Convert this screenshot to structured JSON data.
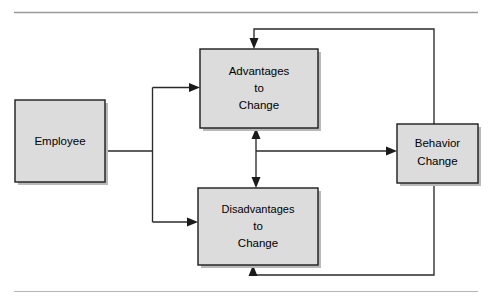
{
  "figure": {
    "type": "flow-diagram",
    "title_fragment": "",
    "background_color": "#ffffff",
    "box_fill_color": "#dcdcdc",
    "box_border_color": "#1c1c1c",
    "connector_color": "#2a2a2a",
    "rule_color": "#9a9a9a"
  },
  "rules": {
    "top_rule_label": "top-horizontal-rule",
    "bottom_rule_label": "bottom-horizontal-rule"
  },
  "nodes": [
    {
      "id": "employee",
      "lines": [
        "Employee"
      ],
      "x": 15,
      "y": 100,
      "w": 90,
      "h": 82
    },
    {
      "id": "advantages",
      "lines": [
        "Advantages",
        "to",
        "Change"
      ],
      "x": 200,
      "y": 49,
      "w": 118,
      "h": 79
    },
    {
      "id": "disadvantages",
      "lines": [
        "Disadvantages",
        "to",
        "Change"
      ],
      "x": 198,
      "y": 188,
      "w": 120,
      "h": 77
    },
    {
      "id": "behavior_change",
      "lines": [
        "Behavior",
        "Change"
      ],
      "x": 397,
      "y": 124,
      "w": 81,
      "h": 59
    }
  ],
  "node_text": {
    "employee": "Employee",
    "advantages_line1": "Advantages",
    "advantages_line2": "to",
    "advantages_line3": "Change",
    "disadvantages_line1": "Disadvantages",
    "disadvantages_line2": "to",
    "disadvantages_line3": "Change",
    "behavior_line1": "Behavior",
    "behavior_line2": "Change"
  },
  "edges": [
    {
      "id": "employee-to-split",
      "from": "employee",
      "to": "split-junction",
      "arrow": false
    },
    {
      "id": "split-to-advantages",
      "from": "split-junction",
      "to": "advantages",
      "arrow": true
    },
    {
      "id": "split-to-disadvantages",
      "from": "split-junction",
      "to": "disadvantages",
      "arrow": true
    },
    {
      "id": "advantages-disadvantages-bidirectional",
      "from": "advantages",
      "to": "disadvantages",
      "arrow": true,
      "double_headed": true
    },
    {
      "id": "midpoint-to-behavior",
      "from": "mid-junction",
      "to": "behavior_change",
      "arrow": true
    },
    {
      "id": "behavior-feedback-top",
      "from": "behavior_change",
      "to": "advantages",
      "arrow": true
    },
    {
      "id": "behavior-feedback-bottom",
      "from": "behavior_change",
      "to": "disadvantages",
      "arrow": true
    }
  ]
}
